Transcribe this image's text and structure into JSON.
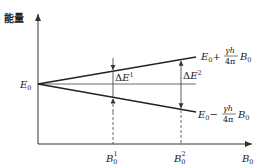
{
  "diagram": {
    "type": "energy-level-splitting",
    "axes": {
      "y_label": "能量",
      "x_label_main": "B",
      "x_label_sub": "0"
    },
    "origin_label": {
      "main": "E",
      "sub": "0"
    },
    "upper_line_label": {
      "base": "E",
      "base_sub": "0",
      "sign": "+",
      "numerator": "γh",
      "denominator": "4π",
      "field": "B",
      "field_sub": "0"
    },
    "lower_line_label": {
      "base": "E",
      "base_sub": "0",
      "sign": "−",
      "numerator": "γh",
      "denominator": "4π",
      "field": "B",
      "field_sub": "0"
    },
    "gaps": [
      {
        "label": "ΔE",
        "sup": "1",
        "field_label": "B",
        "field_sub": "0",
        "field_sup": "1"
      },
      {
        "label": "ΔE",
        "sup": "2",
        "field_label": "B",
        "field_sub": "0",
        "field_sup": "2"
      }
    ],
    "colors": {
      "line": "#222222",
      "axis": "#333333",
      "dashed": "#444444",
      "background": "#ffffff"
    }
  }
}
